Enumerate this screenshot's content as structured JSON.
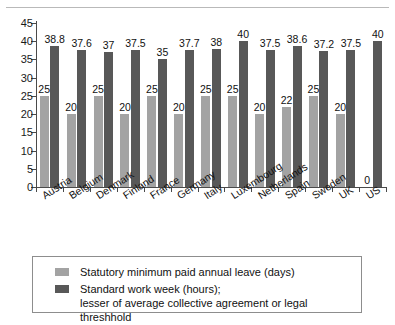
{
  "chart_data": {
    "type": "bar",
    "title": "",
    "subtitle": "",
    "xlabel": "",
    "ylabel": "",
    "ylim": [
      0,
      45
    ],
    "yticks": [
      0,
      5,
      10,
      15,
      20,
      25,
      30,
      35,
      40,
      45
    ],
    "grid": false,
    "legend_position": "bottom",
    "categories": [
      "Austria",
      "Belgium",
      "Denmark",
      "Finland",
      "France",
      "Germany",
      "Italy",
      "Luxembourg",
      "Netherlands",
      "Spain",
      "Sweden",
      "UK",
      "US"
    ],
    "series": [
      {
        "name": "Statutory minimum paid annual leave (days)",
        "color": "#a3a3a3",
        "values": [
          25,
          20,
          25,
          20,
          25,
          20,
          25,
          25,
          20,
          22,
          25,
          20,
          0
        ],
        "labels": [
          "25",
          "20",
          "25",
          "20",
          "25",
          "20",
          "25",
          "25",
          "20",
          "22",
          "25",
          "20",
          "0"
        ]
      },
      {
        "name": "Standard work week (hours); lesser of average collective agreement or legal threshhold",
        "color": "#585858",
        "values": [
          38.8,
          37.6,
          37,
          37.5,
          35,
          37.7,
          38,
          40,
          37.5,
          38.6,
          37.2,
          37.5,
          40
        ],
        "labels": [
          "38.8",
          "37.6",
          "37",
          "37.5",
          "35",
          "37.7",
          "38",
          "40",
          "37.5",
          "38.6",
          "37.2",
          "37.5",
          "40"
        ]
      }
    ]
  },
  "legend": {
    "items": [
      {
        "swatch": "light",
        "line1": "Statutory minimum paid annual leave (days)",
        "line2": ""
      },
      {
        "swatch": "dark",
        "line1": "Standard work week (hours);",
        "line2": "lesser of average collective agreement or legal threshhold"
      }
    ]
  }
}
